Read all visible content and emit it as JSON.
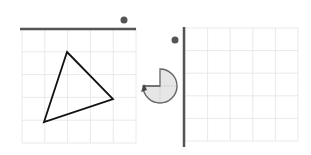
{
  "colors": {
    "grid_line": "#e4e4e4",
    "mirror_line": "#555555",
    "shape_stroke": "#111111",
    "dot": "#555555",
    "rotation_fill": "#e6e6e6",
    "rotation_stroke": "#666666"
  },
  "left_panel": {
    "grid": {
      "x": 22,
      "y": 29,
      "cols": 5,
      "rows": 5,
      "cell": 22.8
    },
    "mirror_line": {
      "orientation": "horizontal",
      "position": "top"
    },
    "dot": {
      "cx": 124,
      "cy": 20
    },
    "triangle": {
      "vertices": [
        [
          67,
          52
        ],
        [
          113,
          99
        ],
        [
          44,
          122
        ]
      ]
    }
  },
  "rotation_icon": {
    "cx": 160,
    "cy": 86,
    "r": 17,
    "quarter_cut": "top-right",
    "arrow": "counter-clockwise"
  },
  "right_panel": {
    "grid": {
      "x": 185,
      "y": 28,
      "cols": 5,
      "rows": 5,
      "cell": 22.6
    },
    "mirror_line": {
      "orientation": "vertical",
      "position": "left"
    },
    "dot": {
      "cx": 175,
      "cy": 40
    },
    "shape": "empty"
  }
}
